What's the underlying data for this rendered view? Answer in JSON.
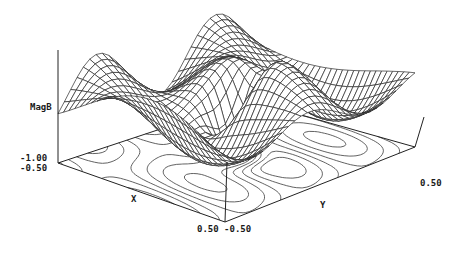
{
  "chart_data": {
    "type": "surface3d",
    "title": "",
    "zlabel": "MagB",
    "xlabel": "X",
    "ylabel": "Y",
    "x_range": [
      -0.5,
      0.5
    ],
    "y_range": [
      -0.5,
      0.5
    ],
    "z_floor": -1.0,
    "tick_labels": {
      "z_min": "-1.00",
      "x_min": "-0.50",
      "x_max": "0.50",
      "y_min": "-0.50",
      "y_max": "0.50"
    },
    "grid_resolution": 30,
    "contours_on_floor": true,
    "surface_description": "Wavy wireframe surface with ridges along Y; dips to floor at center (x=0,y=0); peaks near the back-left and right ridges",
    "contour_levels": 8
  },
  "labels": {
    "zlabel": "MagB",
    "zmin": "-1.00",
    "xmin": "-0.50",
    "xmax_ymin": "0.50 -0.50",
    "ymax": "0.50",
    "xaxis": "X",
    "yaxis": "Y"
  }
}
